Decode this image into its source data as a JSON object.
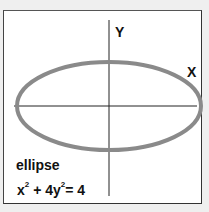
{
  "diagram": {
    "axis_labels": {
      "x": "X",
      "y": "Y"
    },
    "curve_name": "ellipse",
    "equation": {
      "term1_base": "x",
      "term1_exp": "2",
      "plus": " + 4",
      "term2_base": "y",
      "term2_exp": "2",
      "rhs": "= 4"
    },
    "colors": {
      "ellipse_stroke": "#8a8a8a",
      "axis": "#222222",
      "frame_border": "#333333",
      "background": "#ffffff"
    }
  }
}
